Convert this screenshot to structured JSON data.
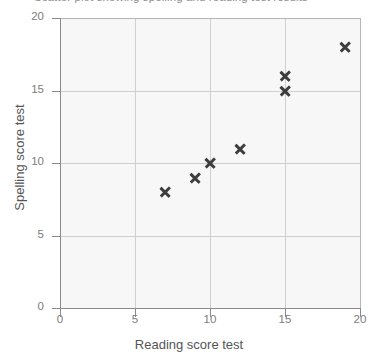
{
  "chart_data": {
    "type": "scatter",
    "title": "Scatter plot showing spelling and reading test results",
    "xlabel": "Reading score test",
    "ylabel": "Spelling score test",
    "xlim": [
      0,
      20
    ],
    "ylim": [
      0,
      20
    ],
    "xticks": [
      "0",
      "5",
      "10",
      "15",
      "20"
    ],
    "yticks": [
      "0",
      "5",
      "10",
      "15",
      "20"
    ],
    "xtick_values": [
      0,
      5,
      10,
      15,
      20
    ],
    "ytick_values": [
      0,
      5,
      10,
      15,
      20
    ],
    "grid": true,
    "legend": "none",
    "marker": "x",
    "marker_color": "#3d3d3d",
    "plot_background": "#f7f7f7",
    "points": [
      {
        "x": 7,
        "y": 8
      },
      {
        "x": 9,
        "y": 9
      },
      {
        "x": 10,
        "y": 10
      },
      {
        "x": 12,
        "y": 11
      },
      {
        "x": 15,
        "y": 15
      },
      {
        "x": 15,
        "y": 16
      },
      {
        "x": 19,
        "y": 18
      }
    ]
  }
}
